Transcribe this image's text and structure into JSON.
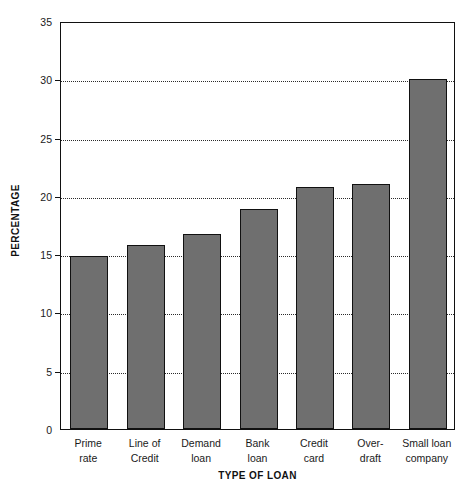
{
  "chart_data": {
    "type": "bar",
    "title": "",
    "xlabel": "TYPE OF LOAN",
    "ylabel": "PERCENTAGE",
    "categories": [
      "Prime rate",
      "Line of Credit",
      "Demand loan",
      "Bank loan",
      "Credit card",
      "Over-draft",
      "Small loan company"
    ],
    "category_lines": [
      [
        "Prime",
        "rate"
      ],
      [
        "Line of",
        "Credit"
      ],
      [
        "Demand",
        "loan"
      ],
      [
        "Bank",
        "loan"
      ],
      [
        "Credit",
        "card"
      ],
      [
        "Over-",
        "draft"
      ],
      [
        "Small loan",
        "company"
      ]
    ],
    "values": [
      14.8,
      15.8,
      16.7,
      18.9,
      20.8,
      21.0,
      30.0
    ],
    "ylim": [
      0,
      35
    ],
    "yticks": [
      0,
      5,
      10,
      15,
      20,
      25,
      30,
      35
    ],
    "ytick_labels": [
      "0",
      "5",
      "10",
      "15",
      "20",
      "25",
      "30",
      "35"
    ],
    "grid": "horizontal-dotted",
    "legend": "none",
    "bar_color": "#6f6f6f",
    "bar_edge_color": "#111111",
    "axis_color": "#111111",
    "background_color": "#ffffff"
  }
}
